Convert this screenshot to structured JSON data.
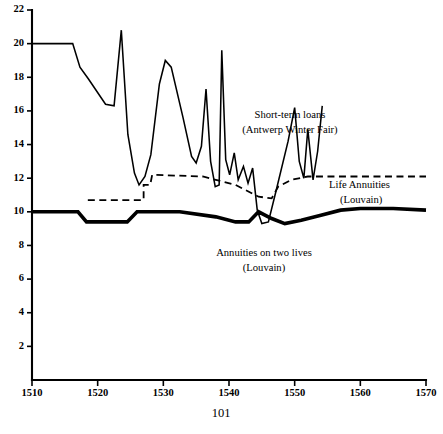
{
  "page": {
    "page_number": "101"
  },
  "chart_data": {
    "type": "line",
    "title": "",
    "xlabel": "",
    "ylabel": "",
    "xlim": [
      1510,
      1570
    ],
    "ylim": [
      0,
      22
    ],
    "grid": false,
    "legend": "inline-annotations",
    "x_ticks": [
      1510,
      1520,
      1530,
      1540,
      1550,
      1560,
      1570
    ],
    "x_tick_labels": [
      "1510",
      "1520",
      "1530",
      "1540",
      "1550",
      "1560",
      "1570"
    ],
    "y_ticks": [
      2,
      4,
      6,
      8,
      10,
      12,
      14,
      16,
      18,
      20,
      22
    ],
    "y_tick_labels": [
      "2",
      "4",
      "6",
      "8",
      "10",
      "12",
      "14",
      "16",
      "18",
      "20",
      "22"
    ],
    "series": [
      {
        "name": "Short-term loans (Antwerp Winter Fair)",
        "style": "solid-thin",
        "label_line1": "Short-term loans",
        "label_line2": "(Antwerp Winter Fair)",
        "points": [
          [
            1510.0,
            20.0
          ],
          [
            1515.0,
            20.0
          ],
          [
            1516.2,
            20.0
          ],
          [
            1517.3,
            18.6
          ],
          [
            1518.6,
            17.9
          ],
          [
            1521.2,
            16.4
          ],
          [
            1522.5,
            16.3
          ],
          [
            1523.6,
            20.8
          ],
          [
            1524.6,
            14.6
          ],
          [
            1525.6,
            12.3
          ],
          [
            1526.3,
            11.6
          ],
          [
            1527.2,
            12.1
          ],
          [
            1528.1,
            13.4
          ],
          [
            1529.4,
            17.6
          ],
          [
            1530.3,
            19.0
          ],
          [
            1531.2,
            18.6
          ],
          [
            1533.0,
            15.6
          ],
          [
            1534.3,
            13.3
          ],
          [
            1535.0,
            12.9
          ],
          [
            1535.8,
            13.9
          ],
          [
            1536.5,
            17.3
          ],
          [
            1537.2,
            13.0
          ],
          [
            1537.9,
            11.5
          ],
          [
            1538.5,
            11.6
          ],
          [
            1538.9,
            19.6
          ],
          [
            1539.5,
            13.1
          ],
          [
            1540.1,
            12.2
          ],
          [
            1540.8,
            13.5
          ],
          [
            1541.4,
            11.9
          ],
          [
            1542.2,
            12.7
          ],
          [
            1542.9,
            11.7
          ],
          [
            1543.6,
            12.6
          ],
          [
            1544.3,
            10.1
          ],
          [
            1545.0,
            9.3
          ],
          [
            1546.0,
            9.4
          ],
          [
            1547.2,
            11.3
          ],
          [
            1549.0,
            14.2
          ],
          [
            1550.0,
            16.2
          ],
          [
            1550.7,
            13.0
          ],
          [
            1551.4,
            12.0
          ],
          [
            1552.0,
            14.9
          ],
          [
            1552.8,
            11.9
          ],
          [
            1553.5,
            13.6
          ],
          [
            1554.2,
            16.3
          ]
        ]
      },
      {
        "name": "Life Annuities (Louvain)",
        "style": "dashed",
        "label_line1": "Life Annuities",
        "label_line2": "(Louvain)",
        "points": [
          [
            1518.5,
            10.7
          ],
          [
            1527.0,
            10.7
          ],
          [
            1527.0,
            11.6
          ],
          [
            1528.0,
            11.6
          ],
          [
            1528.3,
            12.2
          ],
          [
            1536.0,
            12.1
          ],
          [
            1541.0,
            11.6
          ],
          [
            1544.5,
            10.9
          ],
          [
            1546.5,
            10.8
          ],
          [
            1547.5,
            11.5
          ],
          [
            1549.5,
            11.9
          ],
          [
            1552.0,
            12.1
          ],
          [
            1560.0,
            12.1
          ],
          [
            1570.0,
            12.1
          ]
        ]
      },
      {
        "name": "Annuities on two lives (Louvain)",
        "style": "solid-thick",
        "label_line1": "Annuities on two lives",
        "label_line2": "(Louvain)",
        "points": [
          [
            1510.0,
            10.0
          ],
          [
            1517.0,
            10.0
          ],
          [
            1518.3,
            9.4
          ],
          [
            1524.5,
            9.4
          ],
          [
            1526.0,
            10.0
          ],
          [
            1532.5,
            10.0
          ],
          [
            1538.0,
            9.7
          ],
          [
            1541.0,
            9.4
          ],
          [
            1543.0,
            9.4
          ],
          [
            1544.5,
            10.0
          ],
          [
            1546.5,
            9.6
          ],
          [
            1548.5,
            9.3
          ],
          [
            1551.0,
            9.5
          ],
          [
            1554.0,
            9.8
          ],
          [
            1557.0,
            10.1
          ],
          [
            1560.0,
            10.2
          ],
          [
            1565.0,
            10.2
          ],
          [
            1570.0,
            10.1
          ]
        ]
      }
    ],
    "annotations": [
      {
        "id": "shortterm-label",
        "line1": "Short-term loans",
        "line2": "(Antwerp Winter Fair)"
      },
      {
        "id": "lifeann-label",
        "line1": "Life Annuities",
        "line2": "(Louvain)"
      },
      {
        "id": "twolives-label",
        "line1": "Annuities on two lives",
        "line2": "(Louvain)"
      }
    ]
  }
}
